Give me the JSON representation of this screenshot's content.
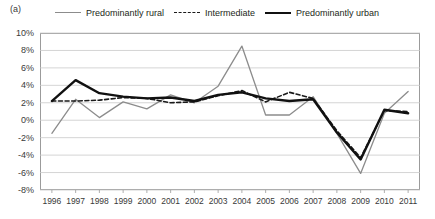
{
  "panel_label": "(a)",
  "legend": {
    "position": "top",
    "items": [
      {
        "name": "Predominantly rural",
        "style": "rural",
        "color": "#8c8c8c"
      },
      {
        "name": "Intermediate",
        "style": "inter",
        "color": "#1a1a1a"
      },
      {
        "name": "Predominantly urban",
        "style": "urban",
        "color": "#111111"
      }
    ]
  },
  "chart_data": {
    "type": "line",
    "title": "",
    "subtitle": "",
    "xlabel": "",
    "ylabel": "",
    "grid": true,
    "legend_position": "top",
    "ylim": [
      -8,
      10
    ],
    "ytick_values": [
      10,
      8,
      6,
      4,
      2,
      0,
      -2,
      -4,
      -6,
      -8
    ],
    "ytick_labels": [
      "10%",
      "8%",
      "6%",
      "4%",
      "2%",
      "0%",
      "-2%",
      "-4%",
      "-6%",
      "-8%"
    ],
    "categories": [
      "1996",
      "1997",
      "1998",
      "1999",
      "2000",
      "2001",
      "2002",
      "2003",
      "2004",
      "2005",
      "2006",
      "2007",
      "2008",
      "2009",
      "2010",
      "2011"
    ],
    "x": [
      1996,
      1997,
      1998,
      1999,
      2000,
      2001,
      2002,
      2003,
      2004,
      2005,
      2006,
      2007,
      2008,
      2009,
      2010,
      2011
    ],
    "series": [
      {
        "name": "Predominantly rural",
        "color": "#8c8c8c",
        "linestyle": "solid",
        "linewidth": 1.3,
        "values": [
          -1.5,
          2.4,
          0.3,
          2.1,
          1.3,
          2.9,
          2.0,
          3.9,
          8.5,
          0.6,
          0.6,
          2.7,
          -1.5,
          -6.1,
          0.8,
          3.3
        ]
      },
      {
        "name": "Intermediate",
        "color": "#1a1a1a",
        "linestyle": "dashed",
        "linewidth": 1.6,
        "values": [
          2.2,
          2.2,
          2.3,
          2.6,
          2.5,
          2.0,
          2.1,
          2.8,
          3.4,
          2.1,
          3.2,
          2.5,
          -1.2,
          -4.3,
          1.1,
          1.0
        ]
      },
      {
        "name": "Predominantly urban",
        "color": "#111111",
        "linestyle": "solid",
        "linewidth": 2.4,
        "values": [
          2.2,
          4.6,
          3.1,
          2.7,
          2.5,
          2.6,
          2.2,
          2.9,
          3.2,
          2.5,
          2.2,
          2.4,
          -1.4,
          -4.5,
          1.2,
          0.8
        ]
      }
    ]
  }
}
